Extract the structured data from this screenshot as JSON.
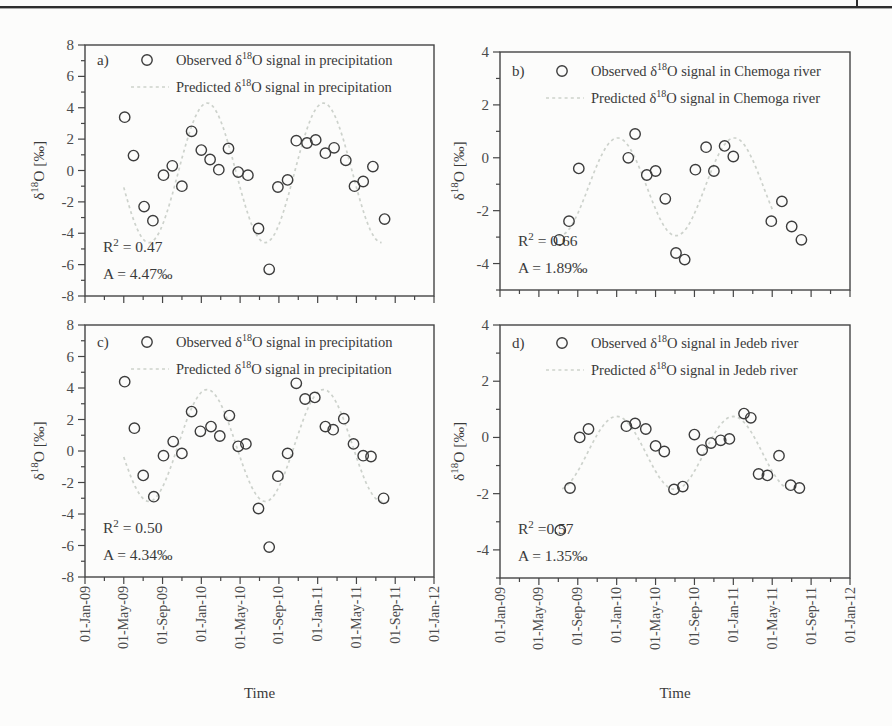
{
  "page": {
    "background": "#fcfcfb",
    "header_rule_color": "#2e2e2e",
    "text_color": "#3a3a3a",
    "frame_color": "#454545",
    "tick_label_color": "#4b4b4b",
    "marker_color": "#3c3c3c",
    "predicted_line_color": "#cdd2cc"
  },
  "figure": {
    "xlabel": "Time",
    "ylabel": "δ{18}O [‰]",
    "x_axis": {
      "tick_labels": [
        "01-Jan-09",
        "01-May-09",
        "01-Sep-09",
        "01-Jan-10",
        "01-May-10",
        "01-Sep-10",
        "01-Jan-11",
        "01-May-11",
        "01-Sep-11",
        "01-Jan-12"
      ],
      "major_tick_months": [
        0,
        4,
        8,
        12,
        16,
        20,
        24,
        28,
        32,
        36
      ],
      "minor_tick_step_months": 2,
      "range_months": [
        0,
        36
      ]
    }
  },
  "chart_data": [
    {
      "id": "a",
      "type": "scatter",
      "panel_label": "a)",
      "legend": [
        {
          "marker": "circle",
          "label": "Observed δ{18}O signal in precipitation"
        },
        {
          "marker": "dashed-line",
          "label": "Predicted δ{18}O signal in precipitation"
        }
      ],
      "stats": {
        "r_squared_text": "R{2} = 0.47",
        "amplitude_text": "A = 4.47‰"
      },
      "ylim": [
        -8,
        8
      ],
      "y_major_step": 2,
      "y_minor_step": 1,
      "x_unit": "months_since_01-Jan-09",
      "observed_points": [
        [
          4.1,
          3.4
        ],
        [
          5.0,
          0.95
        ],
        [
          6.1,
          -2.3
        ],
        [
          7.0,
          -3.2
        ],
        [
          8.1,
          -0.3
        ],
        [
          9.0,
          0.3
        ],
        [
          10.0,
          -1.0
        ],
        [
          11.0,
          2.5
        ],
        [
          12.0,
          1.3
        ],
        [
          12.9,
          0.7
        ],
        [
          13.8,
          0.05
        ],
        [
          14.8,
          1.4
        ],
        [
          15.8,
          -0.1
        ],
        [
          16.8,
          -0.3
        ],
        [
          17.9,
          -3.7
        ],
        [
          19.0,
          -6.3
        ],
        [
          19.9,
          -1.05
        ],
        [
          20.9,
          -0.6
        ],
        [
          21.8,
          1.9
        ],
        [
          22.9,
          1.75
        ],
        [
          23.8,
          1.95
        ],
        [
          24.8,
          1.1
        ],
        [
          25.7,
          1.45
        ],
        [
          26.9,
          0.65
        ],
        [
          27.8,
          -1.0
        ],
        [
          28.7,
          -0.7
        ],
        [
          29.7,
          0.25
        ],
        [
          30.9,
          -3.1
        ]
      ],
      "predicted_sinusoid": {
        "mean": -0.15,
        "amplitude": 4.45,
        "ascending_zero_month": 9.6,
        "period_months": 12,
        "domain_months": [
          4.0,
          30.7
        ]
      }
    },
    {
      "id": "b",
      "type": "scatter",
      "panel_label": "b)",
      "legend": [
        {
          "marker": "circle",
          "label": "Observed δ{18}O signal in Chemoga river"
        },
        {
          "marker": "dashed-line",
          "label": "Predicted δ{18}O signal  in Chemoga river"
        }
      ],
      "stats": {
        "r_squared_text": "R{2} = 0.66",
        "amplitude_text": "A = 1.89‰"
      },
      "ylim": [
        -5,
        4
      ],
      "y_major_step": 2,
      "y_minor_step": 1,
      "x_unit": "months_since_01-Jan-09",
      "observed_points": [
        [
          6.1,
          -3.1
        ],
        [
          7.1,
          -2.4
        ],
        [
          8.1,
          -0.4
        ],
        [
          13.2,
          0.0
        ],
        [
          13.9,
          0.9
        ],
        [
          15.1,
          -0.65
        ],
        [
          16.0,
          -0.5
        ],
        [
          17.0,
          -1.55
        ],
        [
          18.1,
          -3.6
        ],
        [
          19.0,
          -3.85
        ],
        [
          20.1,
          -0.45
        ],
        [
          21.2,
          0.4
        ],
        [
          22.0,
          -0.5
        ],
        [
          23.1,
          0.45
        ],
        [
          24.0,
          0.05
        ],
        [
          27.9,
          -2.4
        ],
        [
          29.0,
          -1.65
        ],
        [
          30.0,
          -2.6
        ],
        [
          31.0,
          -3.1
        ]
      ],
      "predicted_sinusoid": {
        "mean": -1.1,
        "amplitude": 1.85,
        "ascending_zero_month": 9.1,
        "period_months": 12,
        "domain_months": [
          6.0,
          28.0
        ]
      }
    },
    {
      "id": "c",
      "type": "scatter",
      "panel_label": "c)",
      "legend": [
        {
          "marker": "circle",
          "label": "Observed δ{18}O signal in precipitation"
        },
        {
          "marker": "dashed-line",
          "label": "Predicted δ{18}O signal in precipitation"
        }
      ],
      "stats": {
        "r_squared_text": "R{2} = 0.50",
        "amplitude_text": "A = 4.34‰"
      },
      "ylim": [
        -8,
        8
      ],
      "y_major_step": 2,
      "y_minor_step": 1,
      "x_unit": "months_since_01-Jan-09",
      "observed_points": [
        [
          4.1,
          4.4
        ],
        [
          5.1,
          1.45
        ],
        [
          6.0,
          -1.55
        ],
        [
          7.1,
          -2.9
        ],
        [
          8.1,
          -0.3
        ],
        [
          9.1,
          0.6
        ],
        [
          10.0,
          -0.15
        ],
        [
          11.0,
          2.5
        ],
        [
          11.9,
          1.25
        ],
        [
          13.0,
          1.55
        ],
        [
          13.9,
          0.95
        ],
        [
          14.9,
          2.25
        ],
        [
          15.8,
          0.3
        ],
        [
          16.6,
          0.45
        ],
        [
          17.9,
          -3.65
        ],
        [
          19.0,
          -6.1
        ],
        [
          19.9,
          -1.6
        ],
        [
          20.9,
          -0.15
        ],
        [
          21.8,
          4.3
        ],
        [
          22.7,
          3.3
        ],
        [
          23.7,
          3.4
        ],
        [
          24.8,
          1.55
        ],
        [
          25.6,
          1.35
        ],
        [
          26.7,
          2.05
        ],
        [
          27.7,
          0.45
        ],
        [
          28.7,
          -0.3
        ],
        [
          29.5,
          -0.35
        ],
        [
          30.8,
          -3.0
        ]
      ],
      "predicted_sinusoid": {
        "mean": 0.35,
        "amplitude": 3.55,
        "ascending_zero_month": 9.6,
        "period_months": 12,
        "domain_months": [
          4.0,
          30.9
        ]
      }
    },
    {
      "id": "d",
      "type": "scatter",
      "panel_label": "d)",
      "legend": [
        {
          "marker": "circle",
          "label": "Observed δ{18}O signal in Jedeb river"
        },
        {
          "marker": "dashed-line",
          "label": "Predicted δ{18}O signal  in Jedeb river"
        }
      ],
      "stats": {
        "r_squared_text": "R{2} =0.57",
        "amplitude_text": "A = 1.35‰"
      },
      "ylim": [
        -5,
        4
      ],
      "y_major_step": 2,
      "y_minor_step": 1,
      "x_unit": "months_since_01-Jan-09",
      "observed_points": [
        [
          6.2,
          -3.3
        ],
        [
          7.2,
          -1.8
        ],
        [
          8.2,
          0.0
        ],
        [
          9.1,
          0.3
        ],
        [
          13.0,
          0.4
        ],
        [
          13.9,
          0.5
        ],
        [
          15.0,
          0.3
        ],
        [
          16.0,
          -0.3
        ],
        [
          16.9,
          -0.5
        ],
        [
          17.9,
          -1.85
        ],
        [
          18.8,
          -1.75
        ],
        [
          20.0,
          0.1
        ],
        [
          20.8,
          -0.45
        ],
        [
          21.7,
          -0.2
        ],
        [
          22.7,
          -0.1
        ],
        [
          23.6,
          -0.05
        ],
        [
          25.1,
          0.85
        ],
        [
          25.8,
          0.7
        ],
        [
          26.6,
          -1.3
        ],
        [
          27.5,
          -1.35
        ],
        [
          28.7,
          -0.65
        ],
        [
          29.9,
          -1.7
        ],
        [
          30.8,
          -1.8
        ]
      ],
      "predicted_sinusoid": {
        "mean": -0.55,
        "amplitude": 1.3,
        "ascending_zero_month": 9.0,
        "period_months": 12,
        "domain_months": [
          6.4,
          30.5
        ]
      }
    }
  ]
}
